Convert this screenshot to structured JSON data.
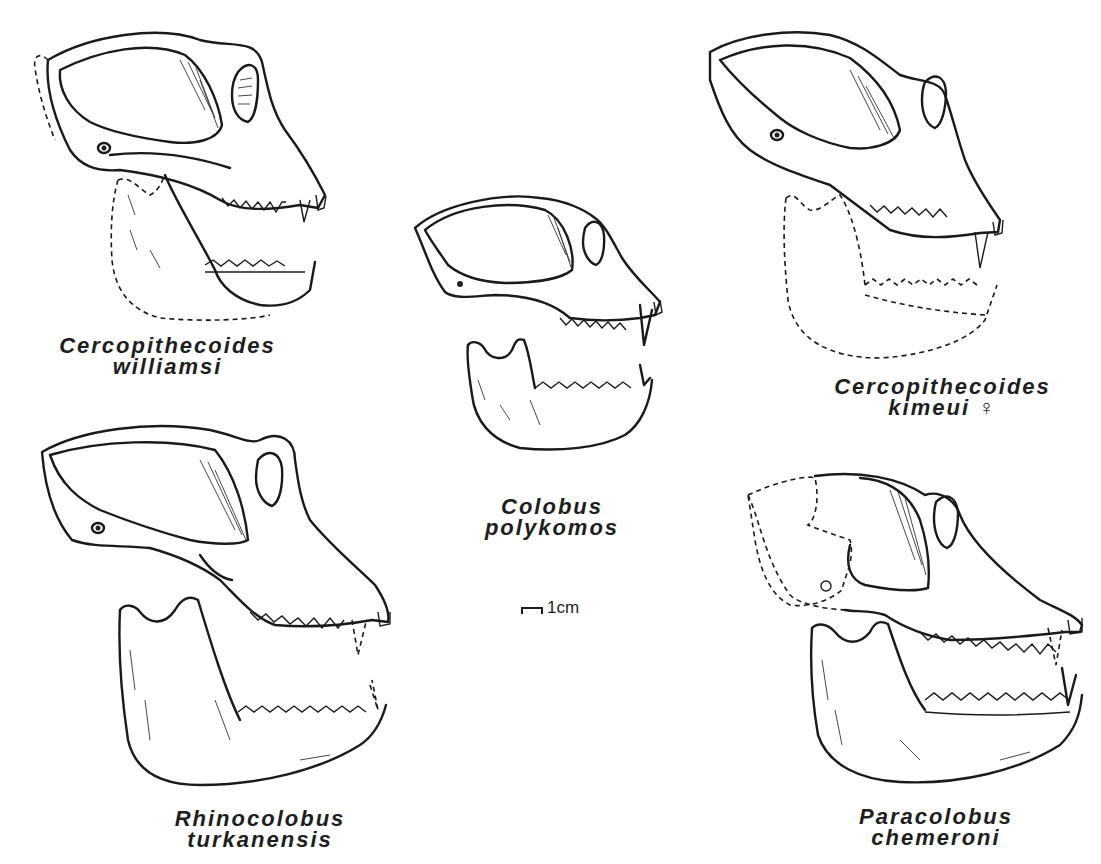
{
  "figure": {
    "type": "comparative skull illustration plate",
    "specimens": [
      {
        "id": "top-left",
        "genus": "Cercopithecoides",
        "species": "williamsi",
        "sex_symbol": "",
        "reconstruction": "partial (dashed outlines)"
      },
      {
        "id": "center",
        "genus": "Colobus",
        "species": "polykomos",
        "sex_symbol": "",
        "reconstruction": "complete"
      },
      {
        "id": "top-right",
        "genus": "Cercopithecoides",
        "species": "kimeui",
        "sex_symbol": "♀",
        "reconstruction": "mandible dashed"
      },
      {
        "id": "bottom-left",
        "genus": "Rhinocolobus",
        "species": "turkanensis",
        "sex_symbol": "",
        "reconstruction": "canines dashed"
      },
      {
        "id": "bottom-right",
        "genus": "Paracolobus",
        "species": "chemeroni",
        "sex_symbol": "",
        "reconstruction": "braincase dashed"
      }
    ],
    "scale_bar": {
      "label": "1cm"
    }
  }
}
